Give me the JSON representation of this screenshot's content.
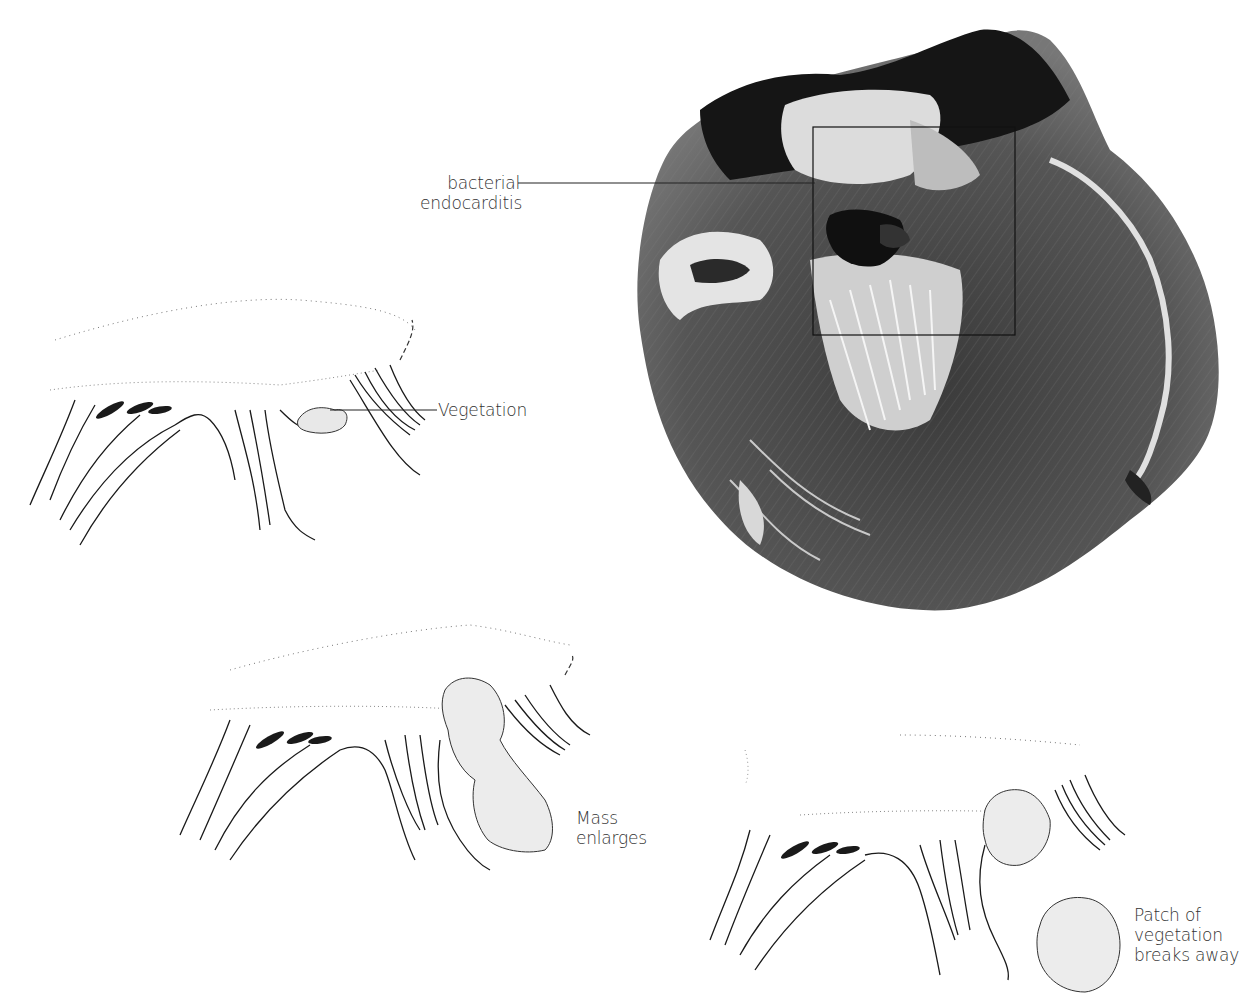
{
  "figure": {
    "photo": {
      "subject": "heart-specimen-photograph",
      "inset_box_label": "bacterial endocarditis"
    },
    "labels": {
      "bacterial_line1": "bacterial",
      "bacterial_line2": "endocarditis",
      "vegetation": "Vegetation",
      "mass_line1": "Mass",
      "mass_line2": "enlarges",
      "patch_line1": "Patch of",
      "patch_line2": "vegetation",
      "patch_line3": "breaks away"
    },
    "panels": [
      {
        "id": "stage-1",
        "caption": "Vegetation"
      },
      {
        "id": "stage-2",
        "caption": "Mass enlarges"
      },
      {
        "id": "stage-3",
        "caption": "Patch of vegetation breaks away"
      }
    ],
    "colors": {
      "ink": "#1a1a1a",
      "photo_dark": "#161616",
      "photo_mid": "#6a6a6a",
      "photo_light": "#e8e8e8",
      "background": "#ffffff"
    }
  }
}
